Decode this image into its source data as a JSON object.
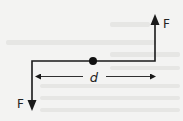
{
  "diagram": {
    "type": "force-couple",
    "labels": {
      "force_top": "F",
      "force_bottom": "F",
      "distance": "d"
    },
    "colors": {
      "background": "#f3f3f2",
      "stroke": "#1a1a1a",
      "ghost_text": "#e4e4e2"
    }
  }
}
